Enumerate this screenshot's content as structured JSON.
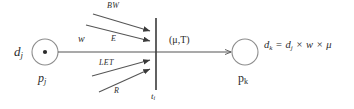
{
  "diagram": {
    "type": "node-link-transfer-diagram",
    "colors": {
      "stroke": "#555555",
      "text": "#2b2b2b",
      "background": "#ffffff"
    },
    "nodes": [
      {
        "id": "pj",
        "role": "source-node",
        "shape": "circle-with-center-dot",
        "value_label": "d",
        "value_sub": "j",
        "name_label": "p",
        "name_sub": "j",
        "cx": 45,
        "cy": 52,
        "r": 13
      },
      {
        "id": "pk",
        "role": "target-node",
        "shape": "circle",
        "name_label": "p",
        "name_sub": "k",
        "cx": 245,
        "cy": 52,
        "r": 13
      }
    ],
    "bar": {
      "id": "ti",
      "role": "transfer-bar",
      "label": "t",
      "sub": "i",
      "x": 156,
      "y_top": 18,
      "y_bottom": 90
    },
    "edges": {
      "weight_label": "w",
      "transfer_pair_label": "(μ,T)"
    },
    "incoming_factors": [
      {
        "id": "bw",
        "label": "BW",
        "position": "top-outer"
      },
      {
        "id": "e",
        "label": "E",
        "position": "top-inner"
      },
      {
        "id": "let",
        "label": "LET",
        "position": "bottom-inner"
      },
      {
        "id": "r",
        "label": "R",
        "position": "bottom-outer"
      }
    ],
    "formula": {
      "lhs": "d",
      "lhs_sub": "k",
      "eq": "=",
      "terms": [
        {
          "text": "d",
          "sub": "j"
        },
        {
          "text": "w",
          "sub": ""
        },
        {
          "text": "μ",
          "sub": ""
        }
      ],
      "operator": "×",
      "full_text": "dₖ = dⱼ × w × μ"
    }
  }
}
